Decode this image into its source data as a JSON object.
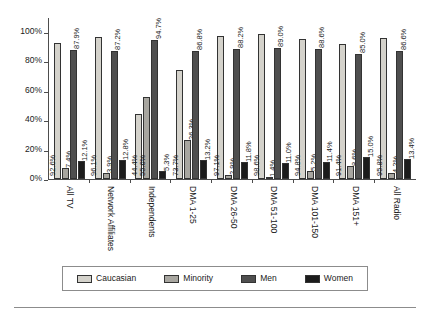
{
  "chart_data": {
    "type": "bar",
    "title": "",
    "subtitle": "",
    "xlabel": "",
    "ylabel": "",
    "ylim": [
      0,
      110
    ],
    "yticks": [
      "0%",
      "20%",
      "40%",
      "60%",
      "80%",
      "100%"
    ],
    "ytick_values": [
      0,
      20,
      40,
      60,
      80,
      100
    ],
    "grid": false,
    "legend_position": "bottom",
    "categories": [
      "All TV",
      "Network Affiliates",
      "Independents",
      "DMA 1-25",
      "DMA 26-50",
      "DMA 51-100",
      "DMA 101-150",
      "DMA 151+",
      "All Radio"
    ],
    "series": [
      {
        "name": "Caucasian",
        "color": "#d4d2cb",
        "values": [
          92.6,
          96.1,
          44.4,
          73.7,
          97.1,
          98.6,
          94.8,
          91.4,
          95.8
        ],
        "labels": [
          "92.6%",
          "96.1%",
          "44.4%",
          "73.7%",
          "97.1%",
          "98.6%",
          "94.8%",
          "91.4%",
          "95.8%"
        ]
      },
      {
        "name": "Minority",
        "color": "#a8a6a0",
        "values": [
          7.4,
          3.9,
          55.6,
          26.3,
          2.9,
          1.4,
          5.2,
          8.6,
          4.2
        ],
        "labels": [
          "7.4%",
          "3.9%",
          "55.6%",
          "26.3%",
          "2.9%",
          "1.4%",
          "5.2%",
          "8.6%",
          "4.2%"
        ]
      },
      {
        "name": "Men",
        "color": "#4f4f4f",
        "values": [
          87.9,
          87.2,
          94.7,
          86.8,
          88.2,
          89.0,
          88.6,
          85.0,
          86.6
        ],
        "labels": [
          "87.9%",
          "87.2%",
          "94.7%",
          "86.8%",
          "88.2%",
          "89.0%",
          "88.6%",
          "85.0%",
          "86.6%"
        ]
      },
      {
        "name": "Women",
        "color": "#1c1c1c",
        "values": [
          12.1,
          12.8,
          5.3,
          13.2,
          11.8,
          11.0,
          11.4,
          15.0,
          13.4
        ],
        "labels": [
          "12.1%",
          "12.8%",
          "5.3%",
          "13.2%",
          "11.8%",
          "11.0%",
          "11.4%",
          "15.0%",
          "13.4%"
        ]
      }
    ]
  }
}
